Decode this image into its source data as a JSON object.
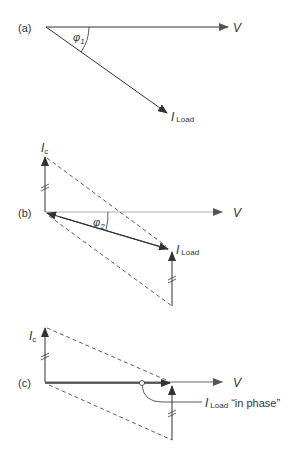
{
  "panels": [
    {
      "id": "a",
      "label": "(a)",
      "voltage_label": "V",
      "angle_label": "φ",
      "angle_sub": "1",
      "current_label": "I",
      "current_sub": "Load"
    },
    {
      "id": "b",
      "label": "(b)",
      "voltage_label": "V",
      "angle_label": "φ",
      "angle_sub": "2",
      "capacitor_label": "I",
      "capacitor_sub": "c",
      "current_label": "I",
      "current_sub": "Load"
    },
    {
      "id": "c",
      "label": "(c)",
      "voltage_label": "V",
      "capacitor_label": "I",
      "capacitor_sub": "c",
      "current_label": "I",
      "current_sub": "Load",
      "note": "“in phase”"
    }
  ],
  "colors": {
    "line": "#333333",
    "thin_line": "#888888",
    "text": "#333333"
  }
}
